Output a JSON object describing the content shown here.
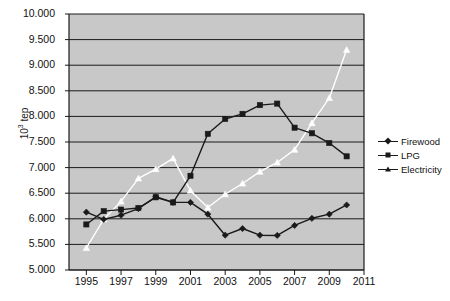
{
  "chart_data": {
    "type": "line",
    "title": "",
    "xlabel": "",
    "ylabel": "10³ tep",
    "ylabel_base": "10",
    "ylabel_exp": "3",
    "ylabel_unit": " tep",
    "xlim": [
      1994,
      2011
    ],
    "ylim": [
      5000,
      10000
    ],
    "grid": true,
    "grid_axis": "y",
    "plot_background": "#c8c8c8",
    "legend_position": "right",
    "xticks": [
      1995,
      1997,
      1999,
      2001,
      2003,
      2005,
      2007,
      2009,
      2011
    ],
    "xtick_labels": [
      "1995",
      "1997",
      "1999",
      "2001",
      "2003",
      "2005",
      "2007",
      "2009",
      "2011"
    ],
    "yticks": [
      5000,
      5500,
      6000,
      6500,
      7000,
      7500,
      8000,
      8500,
      9000,
      9500,
      10000
    ],
    "ytick_labels": [
      "5.000",
      "5.500",
      "6.000",
      "6.500",
      "7.000",
      "7.500",
      "8.000",
      "8.500",
      "9.000",
      "9.500",
      "10.000"
    ],
    "x": [
      1995,
      1996,
      1997,
      1998,
      1999,
      2000,
      2001,
      2002,
      2003,
      2004,
      2005,
      2006,
      2007,
      2008,
      2009,
      2010
    ],
    "series": [
      {
        "name": "Firewood",
        "marker": "diamond",
        "color": "#1a1a1a",
        "line_color": "#1a1a1a",
        "values": [
          6130,
          5990,
          6070,
          6200,
          6430,
          6320,
          6320,
          6090,
          5680,
          5810,
          5680,
          5675,
          5870,
          6010,
          6090,
          6270
        ]
      },
      {
        "name": "LPG",
        "marker": "square",
        "color": "#1a1a1a",
        "line_color": "#1a1a1a",
        "values": [
          5890,
          6150,
          6180,
          6210,
          6420,
          6320,
          6840,
          7660,
          7950,
          8050,
          8220,
          8250,
          7780,
          7670,
          7480,
          7220
        ]
      },
      {
        "name": "Electricity",
        "marker": "triangle",
        "color": "#ffffff",
        "line_color": "#ffffff",
        "values": [
          5430,
          5990,
          6340,
          6790,
          6970,
          7180,
          6550,
          6220,
          6480,
          6690,
          6920,
          7100,
          7350,
          7870,
          8360,
          9300
        ]
      }
    ]
  },
  "legend": {
    "items": [
      {
        "label": "Firewood",
        "marker": "diamond"
      },
      {
        "label": "LPG",
        "marker": "square"
      },
      {
        "label": "Electricity",
        "marker": "triangle"
      }
    ]
  }
}
